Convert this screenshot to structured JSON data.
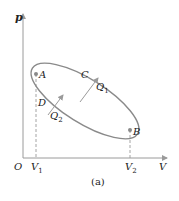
{
  "diagram": {
    "caption": "(a)",
    "axes": {
      "y_label": "p",
      "x_label": "V",
      "origin_label": "O",
      "x_ticks": [
        {
          "label": "V",
          "sub": "1"
        },
        {
          "label": "V",
          "sub": "2"
        }
      ]
    },
    "points": {
      "A": "A",
      "B": "B",
      "C": "C",
      "D": "D"
    },
    "heat": {
      "q1": {
        "label": "Q",
        "sub": "1"
      },
      "q2": {
        "label": "Q",
        "sub": "2"
      }
    },
    "colors": {
      "axis": "#9a9a9a",
      "curve": "#8a8a8a",
      "text": "#222222",
      "dash": "#9a9a9a"
    }
  }
}
